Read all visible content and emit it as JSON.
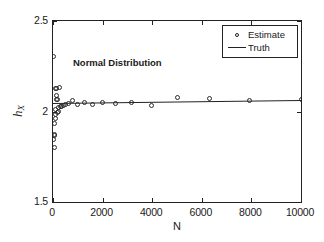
{
  "figure": {
    "background": "#ffffff",
    "axis_color": "#222222",
    "marker_color": "#2a2a2a"
  },
  "annotation": {
    "text": "Normal Distribution"
  },
  "legend": {
    "position": "top-right",
    "entries": [
      {
        "label": "Estimate",
        "symbol": "circle-marker"
      },
      {
        "label": "Truth",
        "symbol": "solid-line"
      }
    ]
  },
  "axes": {
    "xlabel": "N",
    "ylabel_base": "h",
    "ylabel_sub": "X",
    "ylabel": "ĥ_X",
    "xticks": [
      "0",
      "2000",
      "4000",
      "6000",
      "8000",
      "10000"
    ],
    "xtick_values": [
      0,
      2000,
      4000,
      6000,
      8000,
      10000
    ],
    "yticks": [
      "1.5",
      "2",
      "2.5"
    ],
    "ytick_values": [
      1.5,
      2,
      2.5
    ]
  },
  "chart_data": {
    "type": "scatter",
    "title": "Normal Distribution",
    "xlabel": "N",
    "ylabel": "ĥ_X",
    "xlim": [
      0,
      10000
    ],
    "ylim": [
      1.5,
      2.5
    ],
    "grid": false,
    "legend_position": "top-right",
    "series": [
      {
        "name": "Estimate",
        "type": "scatter",
        "marker": "open-circle",
        "points": [
          [
            30,
            2.305
          ],
          [
            40,
            1.845
          ],
          [
            50,
            1.8
          ],
          [
            60,
            1.87
          ],
          [
            70,
            1.872
          ],
          [
            80,
            1.935
          ],
          [
            90,
            1.96
          ],
          [
            100,
            1.985
          ],
          [
            110,
            2.01
          ],
          [
            120,
            2.125
          ],
          [
            130,
            2.128
          ],
          [
            140,
            2.09
          ],
          [
            150,
            2.068
          ],
          [
            170,
            2.065
          ],
          [
            190,
            1.995
          ],
          [
            210,
            2.0
          ],
          [
            230,
            2.02
          ],
          [
            260,
            2.135
          ],
          [
            300,
            2.028
          ],
          [
            360,
            2.03
          ],
          [
            430,
            2.035
          ],
          [
            520,
            2.04
          ],
          [
            640,
            2.045
          ],
          [
            800,
            2.062
          ],
          [
            1000,
            2.038
          ],
          [
            1260,
            2.052
          ],
          [
            1580,
            2.04
          ],
          [
            2000,
            2.05
          ],
          [
            2500,
            2.046
          ],
          [
            3160,
            2.052
          ],
          [
            3980,
            2.032
          ],
          [
            5010,
            2.078
          ],
          [
            6310,
            2.072
          ],
          [
            7940,
            2.062
          ],
          [
            10000,
            2.065
          ]
        ]
      },
      {
        "name": "Truth",
        "type": "line",
        "value": 2.05,
        "points": [
          [
            0,
            2.046
          ],
          [
            10000,
            2.062
          ]
        ]
      }
    ]
  }
}
